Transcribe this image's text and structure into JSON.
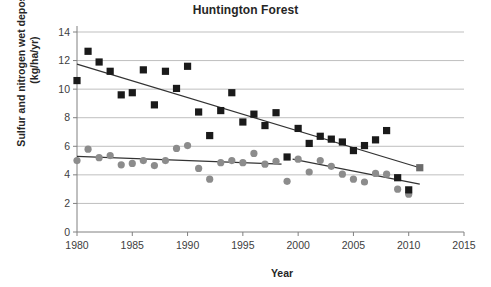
{
  "chart_data": {
    "type": "scatter",
    "title": "Huntington Forest",
    "xlabel": "Year",
    "ylabel": "Sulfur and nitrogen wet deposition (kg/ha/yr)",
    "ylabel_line1": "Sulfur and nitrogen wet deposition",
    "ylabel_line2": "(kg/ha/yr)",
    "xlim": [
      1980,
      2015
    ],
    "ylim": [
      0,
      14
    ],
    "xticks": [
      1980,
      1985,
      1990,
      1995,
      2000,
      2005,
      2010,
      2015
    ],
    "yticks": [
      0,
      2,
      4,
      6,
      8,
      10,
      12,
      14
    ],
    "xtick_labels": [
      "1980",
      "1985",
      "1990",
      "1995",
      "2000",
      "2005",
      "2010",
      "2015"
    ],
    "ytick_labels": [
      "0",
      "2",
      "4",
      "6",
      "8",
      "10",
      "12",
      "14"
    ],
    "grid": "horizontal",
    "legend": "none",
    "colors": {
      "sulfur_marker": "#1a1a1a",
      "nitrogen_marker": "#8c8c8c",
      "trendline": "#333333",
      "gridline": "#bfbfbf",
      "axis": "#808080",
      "text": "#333333"
    },
    "series": [
      {
        "name": "Sulfur wet deposition",
        "marker": "square",
        "color": "#1a1a1a",
        "x": [
          1980,
          1981,
          1982,
          1983,
          1984,
          1985,
          1986,
          1987,
          1988,
          1989,
          1990,
          1991,
          1992,
          1993,
          1994,
          1995,
          1996,
          1997,
          1998,
          1999,
          2000,
          2001,
          2002,
          2003,
          2004,
          2005,
          2006,
          2007,
          2008,
          2009,
          2010,
          2011
        ],
        "values": [
          10.6,
          12.65,
          11.9,
          11.25,
          9.6,
          9.75,
          11.35,
          8.9,
          11.25,
          10.05,
          11.6,
          8.4,
          6.75,
          8.5,
          9.75,
          7.7,
          8.25,
          7.45,
          8.35,
          5.25,
          7.25,
          6.2,
          6.7,
          6.5,
          6.3,
          5.7,
          6.05,
          6.45,
          7.1,
          3.8,
          2.95,
          4.5
        ]
      },
      {
        "name": "Nitrogen wet deposition",
        "marker": "circle",
        "color": "#8c8c8c",
        "x": [
          1980,
          1981,
          1982,
          1983,
          1984,
          1985,
          1986,
          1987,
          1988,
          1989,
          1990,
          1991,
          1992,
          1993,
          1994,
          1995,
          1996,
          1997,
          1998,
          1999,
          2000,
          2001,
          2002,
          2003,
          2004,
          2005,
          2006,
          2007,
          2008,
          2009,
          2010
        ],
        "values": [
          5.0,
          5.8,
          5.2,
          5.35,
          4.7,
          4.8,
          5.0,
          4.65,
          5.0,
          5.85,
          6.05,
          4.45,
          3.7,
          4.85,
          5.0,
          4.85,
          5.5,
          4.75,
          4.95,
          3.55,
          5.1,
          4.2,
          5.0,
          4.6,
          4.05,
          3.7,
          3.5,
          4.1,
          4.05,
          3.0,
          2.65
        ]
      }
    ],
    "trendlines": [
      {
        "name": "Sulfur trendline",
        "x_start": 1980,
        "y_start": 11.75,
        "x_end": 2011,
        "y_end": 4.5
      },
      {
        "name": "Nitrogen trendline",
        "x_start": 1980,
        "y_start": 5.3,
        "x_end": 1998.5,
        "y_end": 4.75
      },
      {
        "name": "Nitrogen trendline late",
        "x_start": 1999.5,
        "y_start": 5.1,
        "x_end": 2011,
        "y_end": 3.35
      }
    ]
  }
}
